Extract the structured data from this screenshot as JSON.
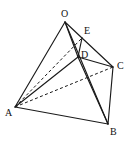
{
  "figure": {
    "background_color": "#ffffff",
    "stroke_color": "#1a1a1a",
    "label_color": "#111111",
    "width": 134,
    "height": 141
  },
  "labels": {
    "O": "O",
    "E": "E",
    "D": "D",
    "C": "C",
    "A": "A",
    "B": "B"
  },
  "chart_data": {
    "type": "diagram",
    "xlabel": "",
    "ylabel": "",
    "points": [
      {
        "name": "O",
        "x": 65,
        "y": 22,
        "label": "O",
        "label_x": 61,
        "label_y": 9
      },
      {
        "name": "E",
        "x": 82,
        "y": 38,
        "label": "E",
        "label_x": 84,
        "label_y": 26
      },
      {
        "name": "D",
        "x": 78,
        "y": 57,
        "label": "D",
        "label_x": 81,
        "label_y": 50
      },
      {
        "name": "C",
        "x": 113,
        "y": 67,
        "label": "C",
        "label_x": 117,
        "label_y": 61
      },
      {
        "name": "A",
        "x": 15,
        "y": 107,
        "label": "A",
        "label_x": 5,
        "label_y": 108
      },
      {
        "name": "B",
        "x": 108,
        "y": 124,
        "label": "B",
        "label_x": 110,
        "label_y": 127
      }
    ],
    "edges": [
      {
        "from": "O",
        "to": "A",
        "style": "solid"
      },
      {
        "from": "O",
        "to": "E",
        "style": "solid"
      },
      {
        "from": "O",
        "to": "D",
        "style": "solid"
      },
      {
        "from": "O",
        "to": "B",
        "style": "solid"
      },
      {
        "from": "E",
        "to": "D",
        "style": "solid"
      },
      {
        "from": "E",
        "to": "C",
        "style": "solid"
      },
      {
        "from": "D",
        "to": "C",
        "style": "solid"
      },
      {
        "from": "D",
        "to": "B",
        "style": "solid"
      },
      {
        "from": "A",
        "to": "D",
        "style": "solid"
      },
      {
        "from": "A",
        "to": "B",
        "style": "solid"
      },
      {
        "from": "B",
        "to": "C",
        "style": "solid"
      },
      {
        "from": "A",
        "to": "E",
        "style": "dashed"
      },
      {
        "from": "A",
        "to": "C",
        "style": "dashed"
      }
    ],
    "legend": [],
    "grid": false
  }
}
